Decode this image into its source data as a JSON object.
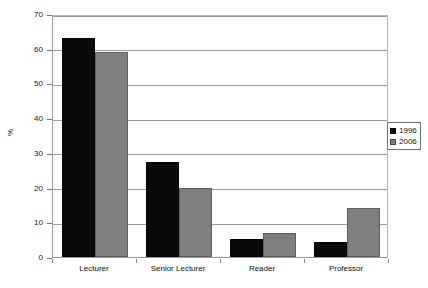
{
  "chart_data": {
    "type": "bar",
    "title": "",
    "xlabel": "",
    "ylabel": "%",
    "ylim": [
      0,
      70
    ],
    "ytick_step": 10,
    "yticks": [
      0,
      10,
      20,
      30,
      40,
      50,
      60,
      70
    ],
    "ytick_labels": [
      "0",
      "10",
      "20",
      "30",
      "40",
      "50",
      "60",
      "70"
    ],
    "grid": true,
    "legend_position": "right",
    "categories": [
      "Lecturer",
      "Senior Lecturer",
      "Reader",
      "Professor"
    ],
    "series": [
      {
        "name": "1996",
        "color": "#0a0a0a",
        "values": [
          63,
          27.5,
          5.2,
          4.3
        ]
      },
      {
        "name": "2006",
        "color": "#7f7f7f",
        "values": [
          59,
          20,
          7,
          14
        ]
      }
    ]
  },
  "legend": {
    "entries": [
      {
        "label": "1996"
      },
      {
        "label": "2006"
      }
    ]
  }
}
